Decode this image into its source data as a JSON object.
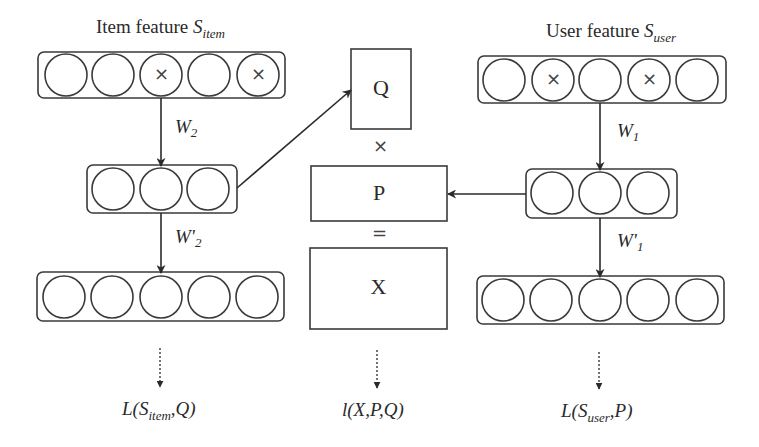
{
  "diagram": {
    "item_side": {
      "title_prefix": "Item feature ",
      "title_symbol": "S",
      "title_subscript": "item",
      "input_layer": {
        "nodes": 5,
        "masked": [
          2,
          4
        ]
      },
      "hidden_layer": {
        "nodes": 3
      },
      "output_layer": {
        "nodes": 5
      },
      "encoder_weight": {
        "symbol": "W",
        "subscript": "2"
      },
      "decoder_weight": {
        "symbol": "W'",
        "subscript": "2"
      },
      "loss": {
        "prefix": "L(",
        "symbol": "S",
        "subscript": "item",
        "suffix": ",Q)"
      }
    },
    "user_side": {
      "title_prefix": "User feature ",
      "title_symbol": "S",
      "title_subscript": "user",
      "input_layer": {
        "nodes": 5,
        "masked": [
          1,
          3
        ]
      },
      "hidden_layer": {
        "nodes": 3
      },
      "output_layer": {
        "nodes": 5
      },
      "encoder_weight": {
        "symbol": "W",
        "subscript": "1"
      },
      "decoder_weight": {
        "symbol": "W'",
        "subscript": "1"
      },
      "loss": {
        "prefix": "L(",
        "symbol": "S",
        "subscript": "user",
        "suffix": ",P)"
      }
    },
    "factorization": {
      "matrix_q": "Q",
      "op_multiply": "×",
      "matrix_p": "P",
      "op_equals": "=",
      "matrix_x": "X",
      "loss": "l(X,P,Q)"
    },
    "mask_glyph": "×",
    "colors": {
      "stroke": "#3a3a3a",
      "background": "#ffffff"
    }
  }
}
